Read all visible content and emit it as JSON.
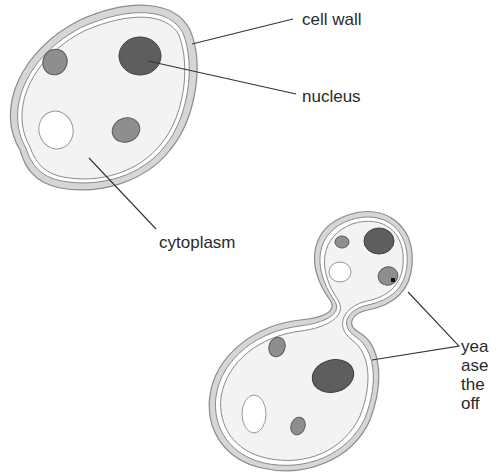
{
  "labels": {
    "cell_wall": "cell wall",
    "nucleus": "nucleus",
    "cytoplasm": "cytoplasm",
    "budding_lines": [
      "yea",
      "ase",
      "the",
      "off"
    ]
  },
  "colors": {
    "wall_fill": "#d6d6d6",
    "wall_stroke": "#8a8a8a",
    "cytoplasm": "#f3f3f3",
    "nucleus": "#5e5e5e",
    "organelle": "#8e8e8e",
    "vacuole": "#ffffff",
    "leader_line": "#333333",
    "text": "#2a2a2a"
  }
}
